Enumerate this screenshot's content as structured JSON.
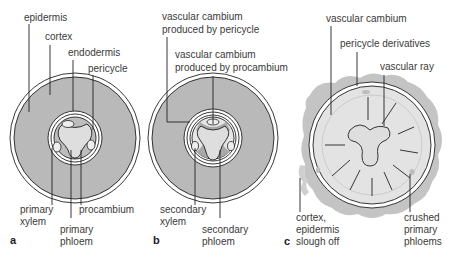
{
  "figure": {
    "panels": [
      {
        "letter": "a",
        "labels": {
          "epidermis": "epidermis",
          "cortex": "cortex",
          "endodermis": "endodermis",
          "pericycle": "pericycle",
          "primary_xylem_1": "primary",
          "primary_xylem_2": "xylem",
          "procambium": "procambium",
          "primary_phloem_1": "primary",
          "primary_phloem_2": "phloem"
        }
      },
      {
        "letter": "b",
        "labels": {
          "vc_pericycle_1": "vascular cambium",
          "vc_pericycle_2": "produced by pericycle",
          "vc_procambium_1": "vascular cambium",
          "vc_procambium_2": "produced by procambium",
          "secondary_xylem_1": "secondary",
          "secondary_xylem_2": "xylem",
          "secondary_phloem_1": "secondary",
          "secondary_phloem_2": "phloem"
        }
      },
      {
        "letter": "c",
        "labels": {
          "vascular_cambium": "vascular cambium",
          "pericycle_derivatives": "pericycle derivatives",
          "vascular_ray": "vascular ray",
          "cortex_slough_1": "cortex,",
          "cortex_slough_2": "epidermis",
          "cortex_slough_3": "slough off",
          "crushed_1": "crushed",
          "crushed_2": "primary",
          "crushed_3": "phloems"
        }
      }
    ],
    "colors": {
      "cortex_gray": "#b9b9b9",
      "light_gray": "#dcdcdc",
      "mid_gray": "#a8a8a8",
      "outline": "#222222",
      "label_text": "#3a3a3a"
    }
  }
}
